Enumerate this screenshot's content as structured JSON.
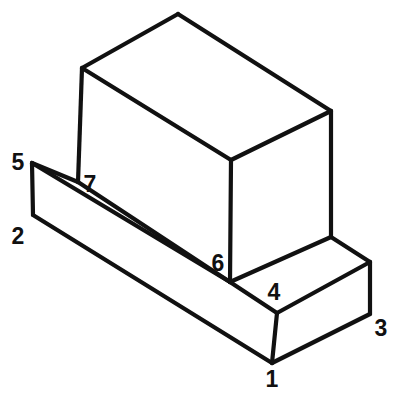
{
  "drawing": {
    "title": "Isometric block with numbered vertices",
    "background_color": "#ffffff",
    "line_color": "#111111",
    "line_width": 4.2,
    "canvas": {
      "width": 396,
      "height": 403
    },
    "object_description": "L-shaped (stepped) solid: rectangular base slab with taller rectangular block resting on its rear-left portion",
    "labels": [
      {
        "id": "1",
        "text": "1",
        "x": 272,
        "y": 381
      },
      {
        "id": "2",
        "text": "2",
        "x": 18,
        "y": 238
      },
      {
        "id": "3",
        "text": "3",
        "x": 381,
        "y": 330
      },
      {
        "id": "4",
        "text": "4",
        "x": 274,
        "y": 294
      },
      {
        "id": "5",
        "text": "5",
        "x": 18,
        "y": 164
      },
      {
        "id": "6",
        "text": "6",
        "x": 218,
        "y": 265
      },
      {
        "id": "7",
        "text": "7",
        "x": 90,
        "y": 186
      }
    ],
    "vertices": {
      "v1": {
        "x": 272,
        "y": 363,
        "name": "base-front-bottom"
      },
      "v2": {
        "x": 33,
        "y": 215,
        "name": "base-left-bottom"
      },
      "v3": {
        "x": 370,
        "y": 314,
        "name": "base-right-bottom"
      },
      "v4": {
        "x": 277,
        "y": 313,
        "name": "base-front-top"
      },
      "v5": {
        "x": 32,
        "y": 163,
        "name": "base-left-top"
      },
      "v6": {
        "x": 230,
        "y": 282,
        "name": "upper-block-front-bottom"
      },
      "v7": {
        "x": 78,
        "y": 182,
        "name": "upper-block-left-bottom"
      },
      "t1": {
        "x": 82,
        "y": 68,
        "name": "upper-top-left"
      },
      "t2": {
        "x": 178,
        "y": 14,
        "name": "upper-top-rear"
      },
      "t3": {
        "x": 331,
        "y": 111,
        "name": "upper-top-right"
      },
      "t4": {
        "x": 231,
        "y": 160,
        "name": "upper-top-front"
      },
      "t5": {
        "x": 331,
        "y": 237,
        "name": "upper-right-bottom"
      },
      "b1": {
        "x": 370,
        "y": 262,
        "name": "base-rear-right-top"
      }
    },
    "faces": {
      "base_top": "32,163 230,282 277,313 370,262 331,237 78,182",
      "base_front_left": "33,215 32,163 230,282 272,363",
      "base_front_right": "272,363 277,313 370,314 370,262 277,313",
      "upper_top": "82,68 178,14 331,111 231,160",
      "upper_left": "82,68 231,160 230,282 78,182",
      "upper_right": "231,160 331,111 331,237 230,282"
    },
    "edges": [
      {
        "name": "upper-top-left-rear",
        "from": "t1",
        "to": "t2"
      },
      {
        "name": "upper-top-rear-right",
        "from": "t2",
        "to": "t3"
      },
      {
        "name": "upper-top-right-front",
        "from": "t3",
        "to": "t4"
      },
      {
        "name": "upper-top-front-left",
        "from": "t4",
        "to": "t1"
      },
      {
        "name": "upper-vert-left",
        "from": "t1",
        "to": "v7"
      },
      {
        "name": "upper-vert-front",
        "from": "t4",
        "to": "v6"
      },
      {
        "name": "upper-vert-right",
        "from": "t3",
        "to": "t5"
      },
      {
        "name": "upper-base-left-front",
        "from": "v7",
        "to": "v6"
      },
      {
        "name": "upper-base-front-right",
        "from": "v6",
        "to": "t5"
      },
      {
        "name": "base-top-left-front",
        "from": "v5",
        "to": "v6"
      },
      {
        "name": "base-top-front-corner",
        "from": "v6",
        "to": "v4"
      },
      {
        "name": "base-top-front-right",
        "from": "v4",
        "to": "b1"
      },
      {
        "name": "base-top-right-rear",
        "from": "t5",
        "to": "b1"
      },
      {
        "name": "base-top-left-rear",
        "from": "v5",
        "to": "v7"
      },
      {
        "name": "base-vert-left",
        "from": "v5",
        "to": "v2"
      },
      {
        "name": "base-front-bottom-left",
        "from": "v2",
        "to": "v1"
      },
      {
        "name": "base-vert-front",
        "from": "v4",
        "to": "v1"
      },
      {
        "name": "base-bottom-front-right",
        "from": "v1",
        "to": "v3"
      },
      {
        "name": "base-vert-right",
        "from": "b1",
        "to": "v3"
      }
    ]
  }
}
